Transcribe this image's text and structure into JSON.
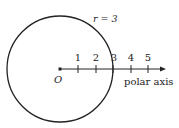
{
  "diagram": {
    "circle_label": "r = 3",
    "origin_label": "O",
    "axis_label": "polar axis",
    "ticks": [
      "1",
      "2",
      "3",
      "4",
      "5"
    ],
    "radius_units": 3,
    "colors": {
      "stroke": "#222222",
      "text": "#222222",
      "background": "#ffffff"
    }
  }
}
